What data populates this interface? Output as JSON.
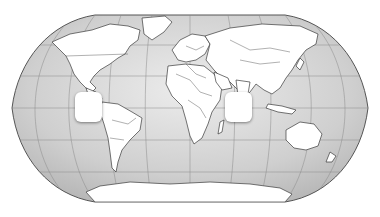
{
  "map": {
    "projection": "Robinson",
    "subject": "World map outline with country borders",
    "colors": {
      "ocean": "#c8c8c8",
      "ocean_light": "#e4e4e4",
      "land": "#ffffff",
      "border": "#3a3a3a",
      "graticule": "#8a8a8a"
    },
    "placeholder_boxes": [
      {
        "id": "americas-box",
        "x": 75,
        "y": 92,
        "w": 27,
        "h": 30,
        "text": ""
      },
      {
        "id": "indian-ocean-box",
        "x": 225,
        "y": 92,
        "w": 27,
        "h": 30,
        "text": ""
      }
    ]
  }
}
